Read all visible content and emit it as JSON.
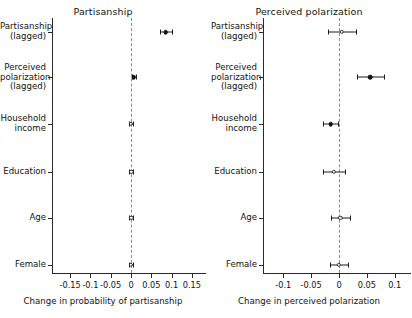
{
  "chart_data": {
    "type": "scatter",
    "title": "",
    "panels": [
      {
        "title": "Partisanship",
        "xlabel": "Change in probability of partisanship",
        "ylabel": "",
        "xlim": [
          -0.165,
          0.165
        ],
        "xticks": [
          -0.15,
          -0.1,
          -0.05,
          0,
          0.05,
          0.1,
          0.15
        ],
        "xticklabels": [
          "-0.15",
          "-0.1",
          "-0.05",
          "0",
          "0.05",
          "0.1",
          "0.15"
        ],
        "grid": false,
        "zero_line": 0,
        "categories": [
          "Partisanship\n(lagged)",
          "Perceived\npolarization\n(lagged)",
          "Household\nincome",
          "Education",
          "Age",
          "Female"
        ],
        "points": [
          {
            "label": "Partisanship (lagged)",
            "estimate": 0.085,
            "ci_low": 0.072,
            "ci_high": 0.101,
            "significant": true
          },
          {
            "label": "Perceived polarization (lagged)",
            "estimate": 0.007,
            "ci_low": 0.003,
            "ci_high": 0.012,
            "significant": true
          },
          {
            "label": "Household income",
            "estimate": 0.0,
            "ci_low": -0.004,
            "ci_high": 0.004,
            "significant": false
          },
          {
            "label": "Education",
            "estimate": 0.001,
            "ci_low": -0.004,
            "ci_high": 0.006,
            "significant": false
          },
          {
            "label": "Age",
            "estimate": 0.001,
            "ci_low": -0.004,
            "ci_high": 0.006,
            "significant": false
          },
          {
            "label": "Female",
            "estimate": -0.001,
            "ci_low": -0.005,
            "ci_high": 0.004,
            "significant": false
          }
        ]
      },
      {
        "title": "Perceived polarization",
        "xlabel": "Change in perceived polarization",
        "ylabel": "",
        "xlim": [
          -0.115,
          0.115
        ],
        "xticks": [
          -0.1,
          -0.05,
          0,
          0.05,
          0.1
        ],
        "xticklabels": [
          "-0.1",
          "-0.05",
          "0",
          "0.05",
          "0.1"
        ],
        "grid": false,
        "zero_line": 0,
        "categories": [
          "Partisanship\n(lagged)",
          "Perceived\npolarization\n(lagged)",
          "Household\nincome",
          "Education",
          "Age",
          "Female"
        ],
        "points": [
          {
            "label": "Partisanship (lagged)",
            "estimate": 0.005,
            "ci_low": -0.02,
            "ci_high": 0.03,
            "significant": false
          },
          {
            "label": "Perceived polarization (lagged)",
            "estimate": 0.056,
            "ci_low": 0.032,
            "ci_high": 0.08,
            "significant": true
          },
          {
            "label": "Household income",
            "estimate": -0.015,
            "ci_low": -0.028,
            "ci_high": -0.001,
            "significant": true
          },
          {
            "label": "Education",
            "estimate": -0.009,
            "ci_low": -0.028,
            "ci_high": 0.01,
            "significant": false
          },
          {
            "label": "Age",
            "estimate": 0.002,
            "ci_low": -0.015,
            "ci_high": 0.02,
            "significant": false
          },
          {
            "label": "Female",
            "estimate": 0.0,
            "ci_low": -0.016,
            "ci_high": 0.017,
            "significant": false
          }
        ]
      }
    ],
    "colors": {
      "point_filled": "#111111",
      "point_hollow_fill": "#ffffff",
      "line": "#1b1b1b",
      "axis": "#2b2b2b",
      "zero_line": "#8e8e8e",
      "background": "#ffffff"
    }
  }
}
